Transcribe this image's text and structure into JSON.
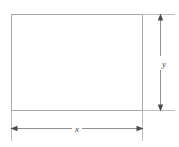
{
  "figure": {
    "type": "geometry-diagram",
    "background_color": "#ffffff",
    "shape": {
      "name": "rectangle",
      "stroke_color": "#a8a8a8",
      "fill_color": "#ffffff",
      "stroke_width": 1,
      "left": 11,
      "top": 14,
      "right": 143,
      "bottom": 111
    },
    "dimensions": [
      {
        "id": "height-dimension",
        "label": "y",
        "orientation": "vertical",
        "line_color": "#8f8f8f",
        "label_color": "#4a4a4a",
        "axis_position": 160,
        "start": 14,
        "end": 111,
        "label_position": 63,
        "extension_lines": [
          {
            "y": 14,
            "x1": 143,
            "x2": 175
          },
          {
            "y": 111,
            "x1": 143,
            "x2": 175
          }
        ]
      },
      {
        "id": "width-dimension",
        "label": "x",
        "orientation": "horizontal",
        "line_color": "#8f8f8f",
        "label_color": "#4a4a4a",
        "axis_position": 128,
        "start": 11,
        "end": 143,
        "label_position": 77,
        "extension_lines": [
          {
            "x": 11,
            "y1": 111,
            "y2": 141
          },
          {
            "x": 143,
            "y1": 111,
            "y2": 141
          }
        ]
      }
    ]
  }
}
